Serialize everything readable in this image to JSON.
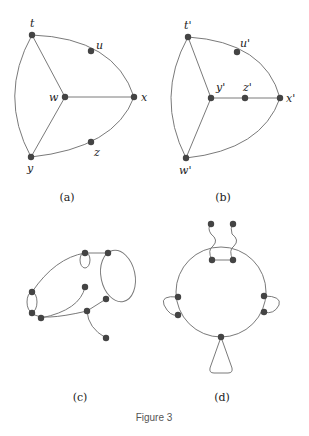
{
  "figure": {
    "caption": "Figure 3",
    "panels": [
      {
        "id": "a",
        "label": "(a)",
        "vertices": [
          "t",
          "u",
          "w",
          "x",
          "y",
          "z"
        ]
      },
      {
        "id": "b",
        "label": "(b)",
        "vertices": [
          "t'",
          "u'",
          "y'",
          "z'",
          "x'",
          "w'"
        ]
      },
      {
        "id": "c",
        "label": "(c)"
      },
      {
        "id": "d",
        "label": "(d)"
      }
    ]
  },
  "colors": {
    "node": "#444444",
    "edge": "#7a7a7a"
  }
}
